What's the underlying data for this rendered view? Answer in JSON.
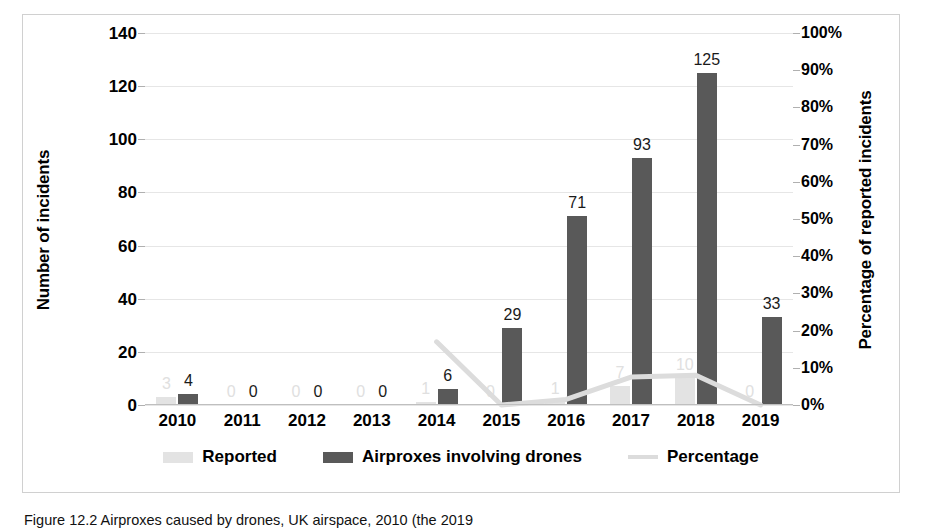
{
  "chart_data": {
    "type": "bar",
    "title": "",
    "categories": [
      "2010",
      "2011",
      "2012",
      "2013",
      "2014",
      "2015",
      "2016",
      "2017",
      "2018",
      "2019"
    ],
    "series": [
      {
        "name": "Reported",
        "kind": "bar",
        "axis": "left",
        "color": "#e3e3e3",
        "values": [
          3,
          0,
          0,
          0,
          1,
          0,
          1,
          7,
          10,
          0
        ],
        "labels": [
          "3",
          "0",
          "0",
          "0",
          "1",
          "0",
          "1",
          "7",
          "10",
          "0"
        ]
      },
      {
        "name": "Airproxes involving drones",
        "kind": "bar",
        "axis": "left",
        "color": "#595959",
        "values": [
          4,
          0,
          0,
          0,
          6,
          29,
          71,
          93,
          125,
          33
        ],
        "labels": [
          "4",
          "0",
          "0",
          "0",
          "6",
          "29",
          "71",
          "93",
          "125",
          "33"
        ]
      },
      {
        "name": "Percentage",
        "kind": "line",
        "axis": "right",
        "color": "#dcdcdc",
        "values": [
          null,
          null,
          null,
          null,
          17,
          0,
          1.5,
          7.5,
          8,
          0
        ]
      }
    ],
    "xlabel": "",
    "ylabel": "Number of incidents",
    "y2label": "Percentage of reported incidents",
    "ylim": [
      0,
      140
    ],
    "y2lim": [
      0,
      100
    ],
    "yticks": [
      "0",
      "20",
      "40",
      "60",
      "80",
      "100",
      "120",
      "140"
    ],
    "y2ticks": [
      "0%",
      "10%",
      "20%",
      "30%",
      "40%",
      "50%",
      "60%",
      "70%",
      "80%",
      "90%",
      "100%"
    ],
    "grid": true,
    "legend_position": "bottom"
  },
  "axes": {
    "left_title": "Number of incidents",
    "right_title": "Percentage of reported incidents"
  },
  "legend": {
    "items": [
      {
        "label": "Reported",
        "type": "bar-light"
      },
      {
        "label": "Airproxes involving drones",
        "type": "bar-dark"
      },
      {
        "label": "Percentage",
        "type": "line"
      }
    ]
  },
  "caption": {
    "text": "Figure 12.2   Airproxes caused by drones, UK airspace, 2010 (the 2019"
  },
  "colors": {
    "bar_dark": "#595959",
    "bar_light": "#e3e3e3",
    "line": "#dcdcdc",
    "gridline": "#e6e6e6",
    "frame": "#d0d0d0"
  }
}
